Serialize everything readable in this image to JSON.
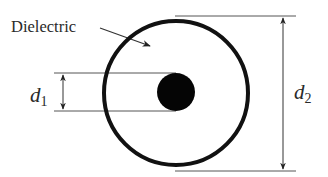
{
  "diagram": {
    "type": "coaxial-cross-section",
    "labels": {
      "dielectric": "Dielectric",
      "inner_diameter_symbol": "d",
      "inner_diameter_subscript": "1",
      "outer_diameter_symbol": "d",
      "outer_diameter_subscript": "2"
    },
    "colors": {
      "stroke": "#111111",
      "line": "#444444",
      "text": "#2a2a2a",
      "background": "#ffffff"
    }
  }
}
